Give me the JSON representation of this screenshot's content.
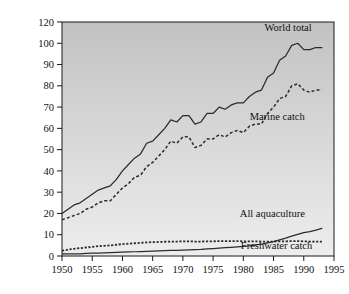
{
  "chart_data": {
    "type": "line",
    "title": "",
    "xlabel": "",
    "ylabel": "Fish caught (million tons)",
    "xlim": [
      1950,
      1995
    ],
    "ylim": [
      0,
      120
    ],
    "grid": false,
    "legend": "inline-annotations",
    "xticks": [
      1950,
      1955,
      1960,
      1965,
      1970,
      1975,
      1980,
      1985,
      1990,
      1995
    ],
    "yticks": [
      0,
      10,
      20,
      30,
      40,
      50,
      60,
      70,
      80,
      90,
      100,
      120
    ],
    "x": [
      1950,
      1951,
      1952,
      1953,
      1954,
      1955,
      1956,
      1957,
      1958,
      1959,
      1960,
      1961,
      1962,
      1963,
      1964,
      1965,
      1966,
      1967,
      1968,
      1969,
      1970,
      1971,
      1972,
      1973,
      1974,
      1975,
      1976,
      1977,
      1978,
      1979,
      1980,
      1981,
      1982,
      1983,
      1984,
      1985,
      1986,
      1987,
      1988,
      1989,
      1990,
      1991,
      1992,
      1993
    ],
    "series": [
      {
        "name": "World total",
        "style": "solid",
        "label": "World total",
        "values": [
          20,
          22,
          24,
          25,
          27,
          29,
          31,
          32,
          33,
          36,
          40,
          43,
          46,
          48,
          53,
          54,
          57,
          60,
          64,
          63,
          66,
          66,
          62,
          63,
          67,
          67,
          70,
          69,
          71,
          72,
          72,
          75,
          77,
          78,
          84,
          86,
          92,
          94,
          99,
          100,
          97,
          97,
          98,
          98
        ]
      },
      {
        "name": "Marine catch",
        "style": "dashed",
        "label": "Marine catch",
        "values": [
          17,
          18,
          19,
          20,
          22,
          23,
          25,
          26,
          26,
          29,
          32,
          34,
          37,
          38,
          42,
          44,
          47,
          50,
          54,
          53,
          56,
          56,
          51,
          52,
          55,
          55,
          57,
          56,
          58,
          59,
          58,
          61,
          62,
          62,
          67,
          70,
          74,
          75,
          80,
          81,
          78,
          77,
          78,
          78
        ]
      },
      {
        "name": "All aquaculture",
        "style": "solid",
        "label": "All aquaculture",
        "values": [
          1,
          1,
          1,
          1,
          1.2,
          1.3,
          1.4,
          1.5,
          1.6,
          1.7,
          1.8,
          1.9,
          2,
          2.1,
          2.2,
          2.3,
          2.4,
          2.5,
          2.6,
          2.7,
          2.8,
          2.9,
          3,
          3.1,
          3.3,
          3.5,
          3.7,
          3.9,
          4.1,
          4.3,
          4.5,
          4.8,
          5.2,
          5.6,
          6.2,
          6.8,
          7.6,
          8.4,
          9.3,
          10.2,
          11,
          11.5,
          12.2,
          13
        ]
      },
      {
        "name": "Freshwater catch",
        "style": "dotted",
        "label": "Freshwater catch",
        "values": [
          2.5,
          3,
          3.4,
          3.7,
          4,
          4.3,
          4.6,
          4.8,
          5,
          5.3,
          5.6,
          5.8,
          6,
          6.2,
          6.4,
          6.5,
          6.6,
          6.7,
          6.8,
          6.8,
          6.9,
          6.9,
          6.8,
          6.8,
          6.9,
          6.9,
          7,
          7,
          7,
          7,
          6.9,
          6.9,
          6.9,
          6.8,
          6.8,
          6.8,
          6.9,
          6.9,
          7,
          7,
          6.9,
          6.8,
          6.8,
          6.8
        ]
      }
    ],
    "annotations": [
      {
        "text": "World total",
        "x": 1987.4,
        "y": 112
      },
      {
        "text": "Marine catch",
        "x": 1985.6,
        "y": 64
      },
      {
        "text": "All aquaculture",
        "x": 1984.8,
        "y": 18.5
      },
      {
        "text": "Freshwater catch",
        "x": 1985.5,
        "y": 3.5
      }
    ],
    "colors": {
      "line": "#2b2b2b",
      "axis": "#1a1a1a",
      "plot_bg_top": "#c6c6c6",
      "plot_bg_bottom": "#eaeaea",
      "text": "#111111"
    }
  }
}
